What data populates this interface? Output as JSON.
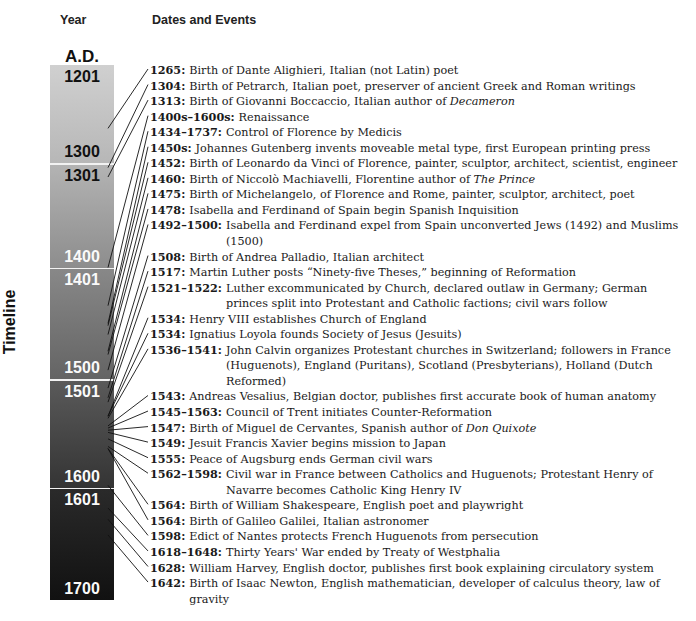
{
  "headers": {
    "year": "Year",
    "events": "Dates and Events"
  },
  "era_label": "A.D.",
  "side_label": "Timeline",
  "colors": {
    "seg1_top": "#d0d0d0",
    "seg1_bot": "#b7b7b7",
    "seg2_top": "#b3b3b3",
    "seg2_bot": "#8d8d8d",
    "seg3_top": "#888888",
    "seg3_bot": "#646464",
    "seg4_top": "#5a5a5a",
    "seg4_bot": "#343434",
    "seg5_top": "#2a2a2a",
    "seg5_bot": "#111111"
  },
  "centuries": [
    {
      "start": "1201",
      "end": "1300"
    },
    {
      "start": "1301",
      "end": "1400"
    },
    {
      "start": "1401",
      "end": "1500"
    },
    {
      "start": "1501",
      "end": "1600"
    },
    {
      "start": "1601",
      "end": "1700"
    }
  ],
  "events": [
    {
      "date": "1265:",
      "text": "Birth of Dante Alighieri, Italian (not Latin) poet"
    },
    {
      "date": "1304:",
      "text": "Birth of Petrarch, Italian poet, preserver of ancient Greek and Roman writings"
    },
    {
      "date": "1313:",
      "text": "Birth of Giovanni Boccaccio, Italian author of ",
      "italic": "Decameron"
    },
    {
      "date": "1400s–1600s:",
      "text": "Renaissance"
    },
    {
      "date": "1434–1737:",
      "text": "Control of Florence by Medicis"
    },
    {
      "date": "1450s:",
      "text": "Johannes Gutenberg invents moveable metal type, first European printing press"
    },
    {
      "date": "1452:",
      "text": "Birth of Leonardo da Vinci of Florence, painter, sculptor, architect, scientist, engineer"
    },
    {
      "date": "1460:",
      "text": "Birth of Niccolò Machiavelli, Florentine author of ",
      "italic": "The Prince"
    },
    {
      "date": "1475:",
      "text": "Birth of Michelangelo, of Florence and Rome, painter, sculptor, architect, poet"
    },
    {
      "date": "1478:",
      "text": "Isabella and Ferdinand of Spain begin Spanish Inquisition"
    },
    {
      "date": "1492–1500:",
      "text": "Isabella and Ferdinand expel from Spain unconverted Jews (1492) and Muslims (1500)"
    },
    {
      "date": "1508:",
      "text": "Birth of Andrea Palladio, Italian architect"
    },
    {
      "date": "1517:",
      "text": "Martin Luther posts “Ninety-five Theses,” beginning of Reformation"
    },
    {
      "date": "1521–1522:",
      "text": "Luther excommunicated by Church, declared outlaw in Germany; German princes split into Protestant and Catholic factions; civil wars follow"
    },
    {
      "date": "1534:",
      "text": "Henry VIII establishes Church of England"
    },
    {
      "date": "1534:",
      "text": "Ignatius Loyola founds Society of Jesus (Jesuits)"
    },
    {
      "date": "1536–1541:",
      "text": "John Calvin organizes Protestant churches in Switzerland; followers in France (Huguenots), England (Puritans), Scotland (Presbyterians), Holland (Dutch Reformed)"
    },
    {
      "date": "1543:",
      "text": "Andreas Vesalius, Belgian doctor, publishes first accurate book of human anatomy"
    },
    {
      "date": "1545–1563:",
      "text": "Council of Trent initiates Counter-Reformation"
    },
    {
      "date": "1547:",
      "text": "Birth of Miguel de Cervantes, Spanish author of ",
      "italic": "Don Quixote"
    },
    {
      "date": "1549:",
      "text": "Jesuit Francis Xavier begins mission to Japan"
    },
    {
      "date": "1555:",
      "text": "Peace of Augsburg ends German civil wars"
    },
    {
      "date": "1562–1598:",
      "text": "Civil war in France between Catholics and Huguenots; Protestant Henry of Navarre becomes Catholic King Henry IV"
    },
    {
      "date": "1564:",
      "text": "Birth of William Shakespeare, English poet and playwright"
    },
    {
      "date": "1564:",
      "text": "Birth of Galileo Galilei, Italian astronomer"
    },
    {
      "date": "1598:",
      "text": "Edict of Nantes protects French Huguenots from persecution"
    },
    {
      "date": "1618–1648:",
      "text": "Thirty Years' War ended by Treaty of Westphalia"
    },
    {
      "date": "1628:",
      "text": "William Harvey, English doctor, publishes first book explaining circulatory system"
    },
    {
      "date": "1642:",
      "text": "Birth of Isaac Newton, English mathematician, developer of calculus theory, law of gravity"
    }
  ]
}
